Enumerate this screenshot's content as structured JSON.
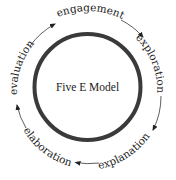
{
  "diagram": {
    "title": "Five E Model",
    "direction": "clockwise",
    "stages": [
      {
        "label": "engagement"
      },
      {
        "label": "exploration"
      },
      {
        "label": "explanation"
      },
      {
        "label": "elaboration"
      },
      {
        "label": "evaluation"
      }
    ],
    "colors": {
      "ring": "#3a3a3a",
      "text": "#1a1a1a",
      "arrows": "#333333",
      "background": "#ffffff"
    }
  }
}
